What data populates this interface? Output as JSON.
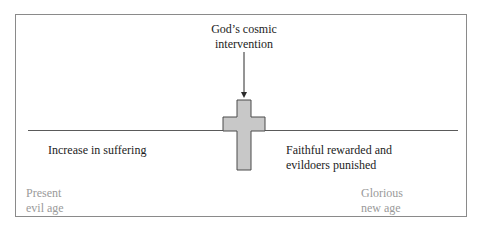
{
  "diagram": {
    "intervention_label_line1": "God’s cosmic",
    "intervention_label_line2": "intervention",
    "left_event_label": "Increase in suffering",
    "right_event_label_line1": "Faithful rewarded and",
    "right_event_label_line2": "evildoers punished",
    "left_age_line1": "Present",
    "left_age_line2": "evil age",
    "right_age_line1": "Glorious",
    "right_age_line2": "new age",
    "cross_symbol": "cross-icon",
    "colors": {
      "cross_fill": "#c8c8c8",
      "cross_stroke": "#4a4a4a",
      "text": "#1c1c1c",
      "muted_text": "#9a9a9a",
      "frame": "#8a8a8a"
    }
  }
}
